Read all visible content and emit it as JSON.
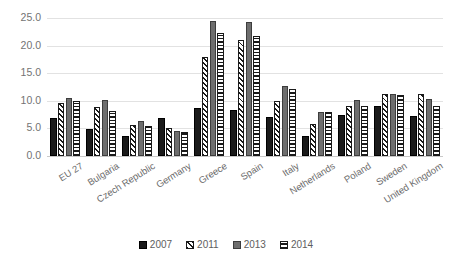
{
  "chart_data": {
    "type": "bar",
    "title": "",
    "xlabel": "",
    "ylabel": "",
    "ylim": [
      0,
      25
    ],
    "ytick_step": 5,
    "ytick_labels": [
      "0.0",
      "5.0",
      "10.0",
      "15.0",
      "20.0",
      "25.0"
    ],
    "grid": true,
    "legend_position": "bottom",
    "categories": [
      "EU 27",
      "Bulgaria",
      "Czech Republic",
      "Germany",
      "Greece",
      "Spain",
      "Italy",
      "Netherlands",
      "Poland",
      "Sweden",
      "United Kingdom"
    ],
    "series": [
      {
        "name": "2007",
        "pattern": "solid-black",
        "color": "#1a1a1a",
        "values": [
          6.9,
          4.9,
          3.6,
          6.8,
          8.7,
          8.3,
          7.0,
          3.6,
          7.5,
          9.0,
          7.3
        ]
      },
      {
        "name": "2011",
        "pattern": "diagonal-hatch",
        "color": "#ffffff",
        "values": [
          9.6,
          8.8,
          5.6,
          5.1,
          17.9,
          21.0,
          9.9,
          5.8,
          9.1,
          11.2,
          11.3
        ]
      },
      {
        "name": "2013",
        "pattern": "solid-gray",
        "color": "#6e6e6e",
        "values": [
          10.6,
          10.1,
          6.3,
          4.6,
          24.5,
          24.2,
          12.7,
          8.0,
          10.1,
          11.3,
          10.4
        ]
      },
      {
        "name": "2014",
        "pattern": "horizontal-stripes",
        "color": "#ffffff",
        "values": [
          10.0,
          8.2,
          5.5,
          4.4,
          22.3,
          21.8,
          12.2,
          7.9,
          9.0,
          11.0,
          9.0
        ]
      }
    ]
  }
}
